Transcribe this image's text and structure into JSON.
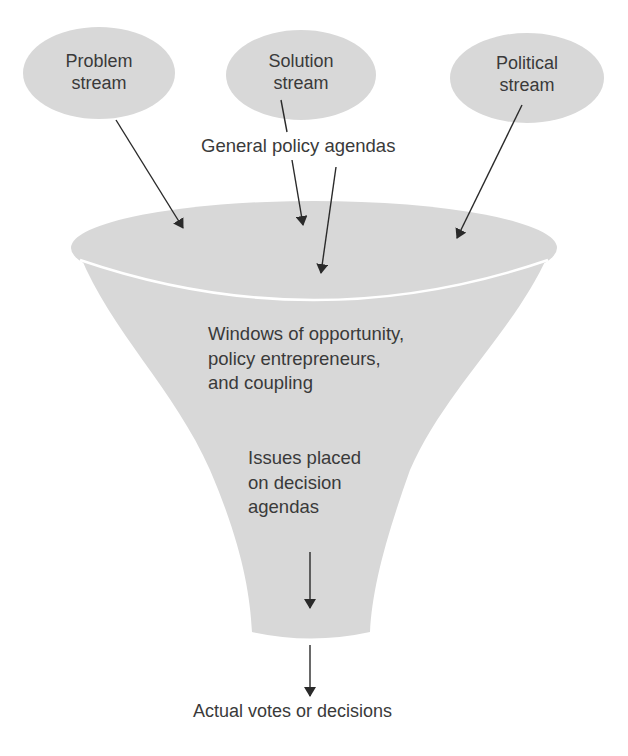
{
  "diagram": {
    "type": "funnel",
    "colors": {
      "fill": "#d8d8d8",
      "rim": "#ffffff",
      "arrow": "#2a2a2a",
      "text": "#3a3a3a"
    },
    "streams": [
      {
        "id": "problem",
        "label": "Problem\nstream"
      },
      {
        "id": "solution",
        "label": "Solution\nstream"
      },
      {
        "id": "political",
        "label": "Political\nstream"
      }
    ],
    "general_label": "General policy agendas",
    "funnel_middle_label": "Windows of opportunity,\npolicy entrepreneurs,\nand coupling",
    "funnel_lower_label": "Issues placed\non decision\nagendas",
    "output_label": "Actual votes or decisions",
    "edges": [
      {
        "from": "Problem stream",
        "to": "General policy agendas"
      },
      {
        "from": "Solution stream",
        "to": "General policy agendas"
      },
      {
        "from": "Political stream",
        "to": "General policy agendas"
      },
      {
        "from": "General policy agendas",
        "to": "Windows of opportunity, policy entrepreneurs, and coupling"
      },
      {
        "from": "Issues placed on decision agendas",
        "to": "Actual votes or decisions"
      }
    ]
  }
}
